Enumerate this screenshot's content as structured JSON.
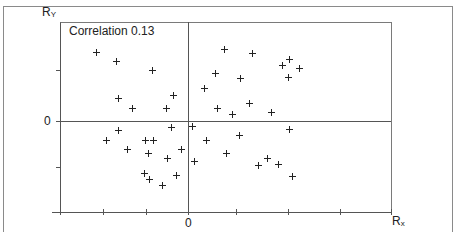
{
  "chart_data": {
    "type": "scatter",
    "title": "",
    "annotation": "Correlation 0.13",
    "xlabel": "Rx",
    "ylabel": "Ry",
    "x_tick_labels": [
      {
        "value": 0,
        "label": "0"
      }
    ],
    "y_tick_labels": [
      {
        "value": 0,
        "label": "0"
      }
    ],
    "xlim": [
      -2.56,
      4.06
    ],
    "ylim": [
      -1.82,
      1.98
    ],
    "grid": false,
    "legend": null,
    "origin_lines": true,
    "marker": "+",
    "points": [
      {
        "x": -1.84,
        "y": 1.38
      },
      {
        "x": -1.44,
        "y": 1.2
      },
      {
        "x": -0.72,
        "y": 1.02
      },
      {
        "x": -1.4,
        "y": 0.46
      },
      {
        "x": -1.12,
        "y": 0.26
      },
      {
        "x": -0.3,
        "y": 0.52
      },
      {
        "x": -0.44,
        "y": 0.26
      },
      {
        "x": 0.72,
        "y": 1.44
      },
      {
        "x": 1.28,
        "y": 1.36
      },
      {
        "x": 1.88,
        "y": 1.12
      },
      {
        "x": 2.02,
        "y": 1.24
      },
      {
        "x": 2.22,
        "y": 1.06
      },
      {
        "x": 2.0,
        "y": 0.88
      },
      {
        "x": 0.54,
        "y": 0.96
      },
      {
        "x": 1.04,
        "y": 0.86
      },
      {
        "x": 0.32,
        "y": 0.66
      },
      {
        "x": 0.58,
        "y": 0.26
      },
      {
        "x": 0.88,
        "y": 0.14
      },
      {
        "x": 1.22,
        "y": 0.36
      },
      {
        "x": 1.66,
        "y": 0.18
      },
      {
        "x": -1.4,
        "y": -0.18
      },
      {
        "x": -1.64,
        "y": -0.38
      },
      {
        "x": -1.22,
        "y": -0.56
      },
      {
        "x": -0.86,
        "y": -0.38
      },
      {
        "x": -0.7,
        "y": -0.38
      },
      {
        "x": -0.8,
        "y": -0.64
      },
      {
        "x": -0.34,
        "y": -0.12
      },
      {
        "x": -0.42,
        "y": -0.74
      },
      {
        "x": -0.14,
        "y": -0.56
      },
      {
        "x": -0.88,
        "y": -1.04
      },
      {
        "x": -0.78,
        "y": -1.16
      },
      {
        "x": -0.24,
        "y": -1.08
      },
      {
        "x": -0.52,
        "y": -1.28
      },
      {
        "x": 0.08,
        "y": -0.1
      },
      {
        "x": 0.36,
        "y": -0.38
      },
      {
        "x": 1.02,
        "y": -0.28
      },
      {
        "x": 0.76,
        "y": -0.64
      },
      {
        "x": 2.02,
        "y": -0.16
      },
      {
        "x": 0.12,
        "y": -0.8
      },
      {
        "x": 1.58,
        "y": -0.74
      },
      {
        "x": 1.4,
        "y": -0.88
      },
      {
        "x": 1.8,
        "y": -0.86
      },
      {
        "x": 2.08,
        "y": -1.1
      }
    ]
  },
  "labels": {
    "ry_main": "R",
    "ry_sub": "Y",
    "rx_main": "R",
    "rx_sub": "x",
    "x_zero": "0",
    "y_zero": "0",
    "correlation": "Correlation 0.13"
  },
  "layout": {
    "x_ticks_px": [
      60,
      103,
      146,
      188,
      236,
      288,
      340,
      391
    ],
    "y_ticks_px": [
      70,
      121,
      167,
      212
    ]
  }
}
